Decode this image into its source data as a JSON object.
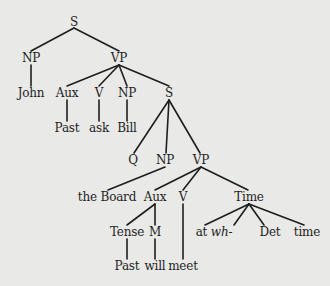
{
  "diagram": {
    "type": "syntax-tree",
    "background": "#e9e9e7",
    "ink": "#1e1e1e",
    "nodes": [
      {
        "id": "s1",
        "label": "S",
        "x": 74,
        "y": 22
      },
      {
        "id": "np1",
        "label": "NP",
        "x": 31,
        "y": 58
      },
      {
        "id": "vp1",
        "label": "VP",
        "x": 119,
        "y": 58
      },
      {
        "id": "john",
        "label": "John",
        "x": 31,
        "y": 93
      },
      {
        "id": "aux1",
        "label": "Aux",
        "x": 67,
        "y": 93
      },
      {
        "id": "v1",
        "label": "V",
        "x": 99,
        "y": 93
      },
      {
        "id": "np2",
        "label": "NP",
        "x": 127,
        "y": 93
      },
      {
        "id": "s2",
        "label": "S",
        "x": 169,
        "y": 93
      },
      {
        "id": "past1",
        "label": "Past",
        "x": 67,
        "y": 128
      },
      {
        "id": "ask",
        "label": "ask",
        "x": 99,
        "y": 128
      },
      {
        "id": "bill",
        "label": "Bill",
        "x": 127,
        "y": 128
      },
      {
        "id": "q",
        "label": "Q",
        "x": 133,
        "y": 160
      },
      {
        "id": "np3",
        "label": "NP",
        "x": 165,
        "y": 160
      },
      {
        "id": "vp2",
        "label": "VP",
        "x": 201,
        "y": 160
      },
      {
        "id": "board",
        "label": "the Board",
        "x": 107,
        "y": 197
      },
      {
        "id": "aux2",
        "label": "Aux",
        "x": 155,
        "y": 197
      },
      {
        "id": "v2",
        "label": "V",
        "x": 183,
        "y": 197
      },
      {
        "id": "time1",
        "label": "Time",
        "x": 249,
        "y": 197
      },
      {
        "id": "tense",
        "label": "Tense",
        "x": 127,
        "y": 232
      },
      {
        "id": "m",
        "label": "M",
        "x": 155,
        "y": 232
      },
      {
        "id": "atwh",
        "label": "at",
        "label_italic": "wh-",
        "x": 214,
        "y": 232
      },
      {
        "id": "det",
        "label": "Det",
        "x": 270,
        "y": 232
      },
      {
        "id": "time2",
        "label": "time",
        "x": 307,
        "y": 232
      },
      {
        "id": "past2",
        "label": "Past",
        "x": 127,
        "y": 266
      },
      {
        "id": "will",
        "label": "will",
        "x": 155,
        "y": 266
      },
      {
        "id": "meet",
        "label": "meet",
        "x": 183,
        "y": 266
      }
    ],
    "edges": [
      {
        "from": [
          74,
          28
        ],
        "to": [
          31,
          51
        ]
      },
      {
        "from": [
          74,
          28
        ],
        "to": [
          119,
          51
        ]
      },
      {
        "from": [
          31,
          65
        ],
        "to": [
          31,
          86
        ]
      },
      {
        "from": [
          119,
          65
        ],
        "to": [
          67,
          86
        ]
      },
      {
        "from": [
          119,
          65
        ],
        "to": [
          99,
          86
        ]
      },
      {
        "from": [
          119,
          65
        ],
        "to": [
          127,
          86
        ]
      },
      {
        "from": [
          119,
          65
        ],
        "to": [
          169,
          86
        ]
      },
      {
        "from": [
          67,
          100
        ],
        "to": [
          67,
          121
        ]
      },
      {
        "from": [
          99,
          100
        ],
        "to": [
          99,
          121
        ]
      },
      {
        "from": [
          127,
          100
        ],
        "to": [
          127,
          121
        ]
      },
      {
        "from": [
          169,
          100
        ],
        "to": [
          134,
          153
        ]
      },
      {
        "from": [
          169,
          100
        ],
        "to": [
          166,
          153
        ]
      },
      {
        "from": [
          169,
          100
        ],
        "to": [
          200,
          153
        ]
      },
      {
        "from": [
          165,
          167
        ],
        "to": [
          108,
          190
        ]
      },
      {
        "from": [
          201,
          167
        ],
        "to": [
          155,
          190
        ]
      },
      {
        "from": [
          201,
          167
        ],
        "to": [
          183,
          190
        ]
      },
      {
        "from": [
          201,
          167
        ],
        "to": [
          248,
          190
        ]
      },
      {
        "from": [
          155,
          204
        ],
        "to": [
          127,
          225
        ]
      },
      {
        "from": [
          155,
          204
        ],
        "to": [
          155,
          225
        ]
      },
      {
        "from": [
          183,
          204
        ],
        "to": [
          183,
          259
        ]
      },
      {
        "from": [
          249,
          204
        ],
        "to": [
          205,
          225
        ]
      },
      {
        "from": [
          249,
          204
        ],
        "to": [
          234,
          225
        ]
      },
      {
        "from": [
          249,
          204
        ],
        "to": [
          264,
          225
        ]
      },
      {
        "from": [
          249,
          204
        ],
        "to": [
          304,
          225
        ]
      },
      {
        "from": [
          127,
          239
        ],
        "to": [
          127,
          259
        ]
      },
      {
        "from": [
          155,
          239
        ],
        "to": [
          155,
          259
        ]
      }
    ]
  }
}
